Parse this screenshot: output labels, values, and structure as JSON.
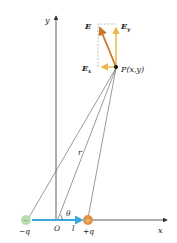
{
  "diagram": {
    "labels": {
      "y_axis": "y",
      "x_axis": "x",
      "E": "E",
      "Ey": "E",
      "Ey_sub": "y",
      "Ex": "E",
      "Ex_sub": "x",
      "point": "P(x,y)",
      "r": "r",
      "theta": "θ",
      "origin": "O",
      "l": "l",
      "neg_charge": "−q",
      "pos_charge": "+q",
      "neg_sign": "−",
      "pos_sign": "+"
    },
    "colors": {
      "vector_E": "#c8782a",
      "vector_components": "#e8b84a",
      "dipole_arrow": "#3ba8e0",
      "neg_charge": "#b8dcb0",
      "pos_charge": "#e0944a",
      "axis": "#333333",
      "lines": "#555555"
    }
  }
}
